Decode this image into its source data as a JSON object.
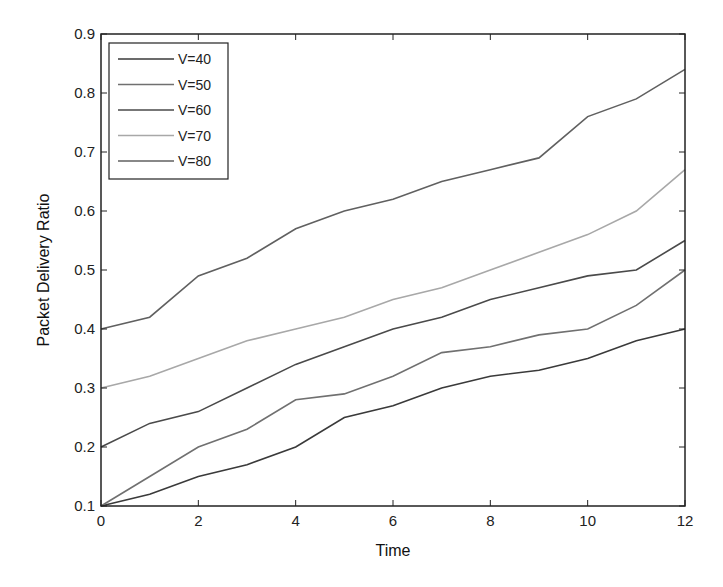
{
  "chart_data": {
    "type": "line",
    "title": "",
    "xlabel": "Time",
    "ylabel": "Packet Delivery Ratio",
    "xlim": [
      0,
      12
    ],
    "ylim": [
      0.1,
      0.9
    ],
    "xticks": [
      0,
      2,
      4,
      6,
      8,
      10,
      12
    ],
    "yticks": [
      0.1,
      0.2,
      0.3,
      0.4,
      0.5,
      0.6,
      0.7,
      0.8,
      0.9
    ],
    "grid": false,
    "legend_position": "upper left",
    "x": [
      0,
      1,
      2,
      3,
      4,
      5,
      6,
      7,
      8,
      9,
      10,
      11,
      12
    ],
    "series": [
      {
        "name": "V=40",
        "color": "#3a3a3a",
        "values": [
          0.1,
          0.12,
          0.15,
          0.17,
          0.2,
          0.25,
          0.27,
          0.3,
          0.32,
          0.33,
          0.35,
          0.38,
          0.4
        ]
      },
      {
        "name": "V=50",
        "color": "#707070",
        "values": [
          0.1,
          0.15,
          0.2,
          0.23,
          0.28,
          0.29,
          0.32,
          0.36,
          0.37,
          0.39,
          0.4,
          0.44,
          0.5
        ]
      },
      {
        "name": "V=60",
        "color": "#4a4a4a",
        "values": [
          0.2,
          0.24,
          0.26,
          0.3,
          0.34,
          0.37,
          0.4,
          0.42,
          0.45,
          0.47,
          0.49,
          0.5,
          0.55
        ]
      },
      {
        "name": "V=70",
        "color": "#a8a8a8",
        "values": [
          0.3,
          0.32,
          0.35,
          0.38,
          0.4,
          0.42,
          0.45,
          0.47,
          0.5,
          0.53,
          0.56,
          0.6,
          0.67
        ]
      },
      {
        "name": "V=80",
        "color": "#606060",
        "values": [
          0.4,
          0.42,
          0.49,
          0.52,
          0.57,
          0.6,
          0.62,
          0.65,
          0.67,
          0.69,
          0.76,
          0.79,
          0.84
        ]
      }
    ]
  }
}
